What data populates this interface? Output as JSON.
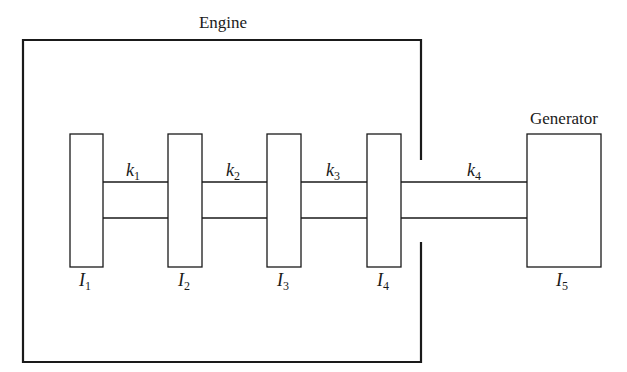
{
  "diagram": {
    "type": "torsional-system schematic",
    "engine_label": "Engine",
    "generator_label": "Generator",
    "inertias": [
      {
        "symbol": "I",
        "subscript": "1"
      },
      {
        "symbol": "I",
        "subscript": "2"
      },
      {
        "symbol": "I",
        "subscript": "3"
      },
      {
        "symbol": "I",
        "subscript": "4"
      },
      {
        "symbol": "I",
        "subscript": "5"
      }
    ],
    "stiffnesses": [
      {
        "symbol": "k",
        "subscript": "1"
      },
      {
        "symbol": "k",
        "subscript": "2"
      },
      {
        "symbol": "k",
        "subscript": "3"
      },
      {
        "symbol": "k",
        "subscript": "4"
      }
    ],
    "colors": {
      "stroke": "#1a1a1a",
      "background": "#ffffff"
    }
  }
}
